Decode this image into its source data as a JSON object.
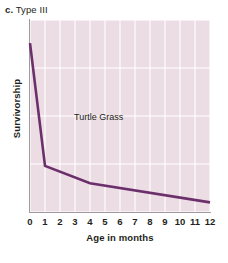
{
  "panel": {
    "letter": "c.",
    "title": "Type III"
  },
  "chart_data": {
    "type": "line",
    "title": "Type III",
    "xlabel": "Age in months",
    "ylabel": "Survivorship",
    "series_label": "Turtle Grass",
    "legend": "none",
    "grid": true,
    "xlim": [
      0,
      12
    ],
    "ylim": [
      0,
      100
    ],
    "xticks": [
      0,
      1,
      2,
      3,
      4,
      5,
      6,
      7,
      8,
      9,
      10,
      11,
      12
    ],
    "xtick_labels": [
      "0",
      "1",
      "2",
      "3",
      "4",
      "5",
      "6",
      "7",
      "8",
      "9",
      "10",
      "11",
      "12"
    ],
    "ytick_labels": [],
    "series": [
      {
        "name": "Turtle Grass",
        "x": [
          0,
          1,
          4,
          12
        ],
        "y": [
          88,
          24,
          15,
          5
        ]
      }
    ],
    "colors": {
      "line": "#6b2f6b",
      "plot_background": "#ecdde4",
      "gridline": "#ffffff",
      "axis": "#9c9ca0",
      "text": "#231f20"
    }
  }
}
